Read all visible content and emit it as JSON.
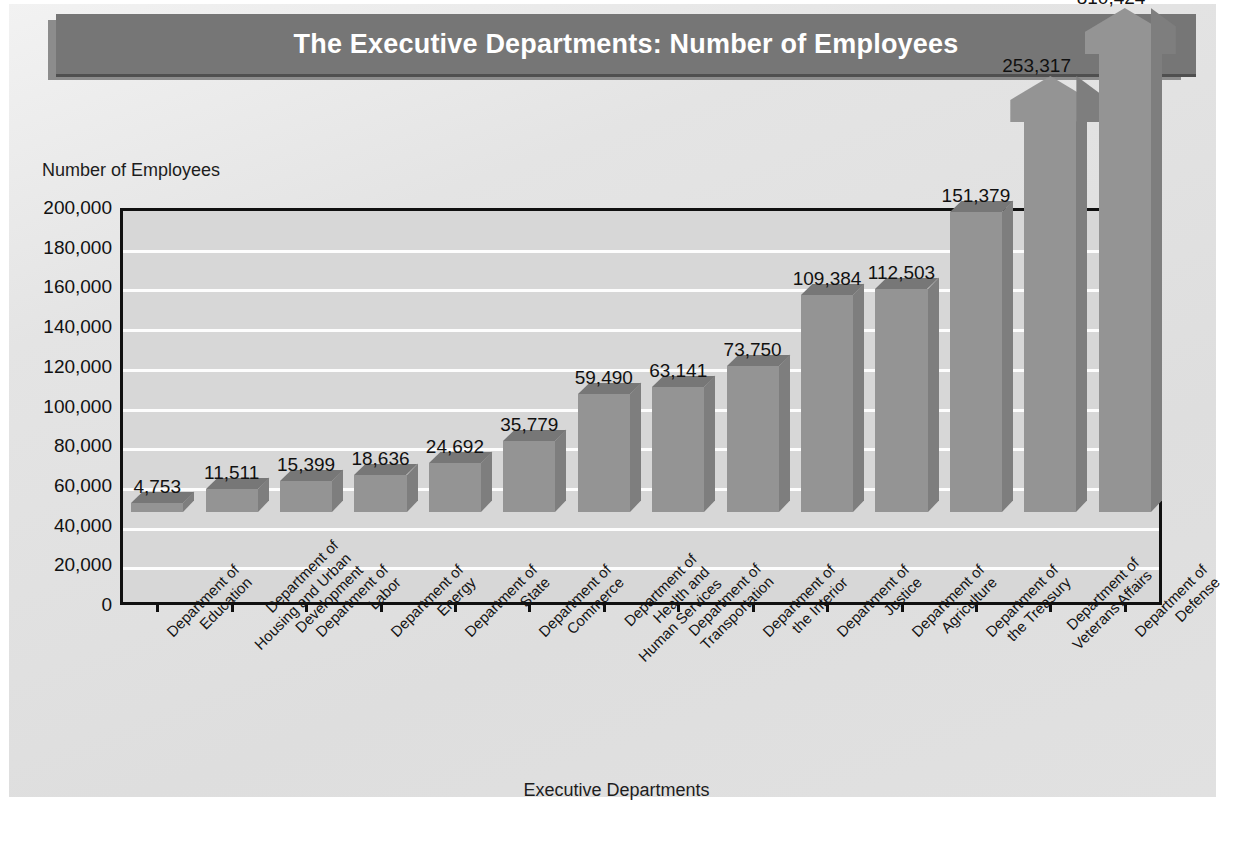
{
  "chart_data": {
    "type": "bar",
    "title": "The Executive Departments: Number of Employees",
    "xlabel": "Executive Departments",
    "ylabel": "Number of Employees",
    "ylim": [
      0,
      200000
    ],
    "ytick_labels": [
      "200,000",
      "180,000",
      "160,000",
      "140,000",
      "120,000",
      "100,000",
      "80,000",
      "60,000",
      "40,000",
      "20,000",
      "0"
    ],
    "ytick_values": [
      200000,
      180000,
      160000,
      140000,
      120000,
      100000,
      80000,
      60000,
      40000,
      20000,
      0
    ],
    "grid": true,
    "legend": "none",
    "note": "Final two bars exceed the 200,000 axis maximum and are drawn as broken/arrow-topped bars.",
    "categories": [
      "Department of Education",
      "Department of Housing and Urban Development",
      "Department of Labor",
      "Department of Energy",
      "Department of State",
      "Department of Commerce",
      "Department of Health and Human Services",
      "Department of Transportation",
      "Department of the Interior",
      "Department of Justice",
      "Department of Agriculture",
      "Department of the Treasury",
      "Department of Veterans Affairs",
      "Department of Defense"
    ],
    "category_lines": [
      [
        "Department of",
        "Education"
      ],
      [
        "Department of",
        "Housing and Urban",
        "Development"
      ],
      [
        "Department of",
        "Labor"
      ],
      [
        "Department of",
        "Energy"
      ],
      [
        "Department of",
        "State"
      ],
      [
        "Department of",
        "Commerce"
      ],
      [
        "Department of",
        "Health and",
        "Human Services"
      ],
      [
        "Department of",
        "Transportation"
      ],
      [
        "Department of",
        "the Interior"
      ],
      [
        "Department of",
        "Justice"
      ],
      [
        "Department of",
        "Agriculture"
      ],
      [
        "Department of",
        "the Treasury"
      ],
      [
        "Department of",
        "Veterans Affairs"
      ],
      [
        "Department of",
        "Defense"
      ]
    ],
    "values": [
      4753,
      11511,
      15399,
      18636,
      24692,
      35779,
      59490,
      63141,
      73750,
      109384,
      112503,
      151379,
      253317,
      810424
    ],
    "value_labels": [
      "4,753",
      "11,511",
      "15,399",
      "18,636",
      "24,692",
      "35,779",
      "59,490",
      "63,141",
      "73,750",
      "109,384",
      "112,503",
      "151,379",
      "253,317",
      "810,424"
    ],
    "broken_bars": [
      12,
      13
    ],
    "colors": {
      "bar_front": "#949494",
      "bar_top": "#777777",
      "bar_side": "#7e7e7e",
      "plot_background": "#d7d7d7",
      "gridline": "#fdfdfd",
      "axis": "#101010",
      "panel_background": "#e2e2e2",
      "title_bar": "#767676",
      "title_shadow": "#8c8c8c",
      "title_text": "#ffffff",
      "text": "#111111"
    }
  }
}
